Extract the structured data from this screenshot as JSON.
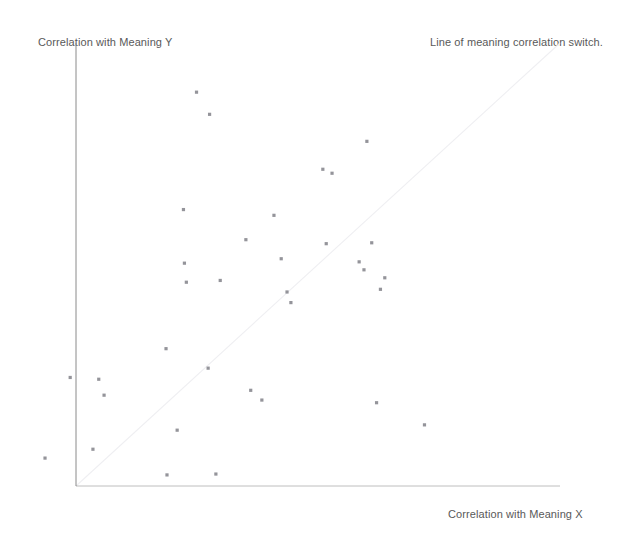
{
  "figure": {
    "title_note": "Line of meaning correlation switch.",
    "ylabel": "Correlation with Meaning Y",
    "xlabel": "Correlation with Meaning X",
    "background_color": "#ffffff",
    "axis_color": "#8a8a8a",
    "marker_color": "#7c7c84",
    "reference_line_color": "#efeff2"
  },
  "chart_data": {
    "type": "scatter",
    "title": "",
    "subtitle": "",
    "xlabel": "Correlation with Meaning X",
    "ylabel": "Correlation with Meaning Y",
    "annotations": [
      "Line of meaning correlation switch."
    ],
    "grid": false,
    "legend": "none",
    "xlim": [
      0,
      1
    ],
    "ylim": [
      0,
      1
    ],
    "axis_ticks": "none",
    "reference_line": {
      "label": "Line of meaning correlation switch.",
      "type": "identity",
      "from": [
        0,
        0
      ],
      "to": [
        1,
        1
      ],
      "style": "faint-solid"
    },
    "series": [
      {
        "name": "meaning correlations",
        "marker": "square",
        "color": "#7c7c84",
        "points": [
          {
            "x": 0.249,
            "y": 0.889
          },
          {
            "x": 0.276,
            "y": 0.839
          },
          {
            "x": 0.601,
            "y": 0.778
          },
          {
            "x": 0.51,
            "y": 0.715
          },
          {
            "x": 0.529,
            "y": 0.706
          },
          {
            "x": 0.222,
            "y": 0.624
          },
          {
            "x": 0.409,
            "y": 0.611
          },
          {
            "x": 0.351,
            "y": 0.556
          },
          {
            "x": 0.517,
            "y": 0.547
          },
          {
            "x": 0.611,
            "y": 0.549
          },
          {
            "x": 0.424,
            "y": 0.513
          },
          {
            "x": 0.224,
            "y": 0.503
          },
          {
            "x": 0.585,
            "y": 0.506
          },
          {
            "x": 0.228,
            "y": 0.46
          },
          {
            "x": 0.595,
            "y": 0.488
          },
          {
            "x": 0.298,
            "y": 0.464
          },
          {
            "x": 0.638,
            "y": 0.47
          },
          {
            "x": 0.629,
            "y": 0.444
          },
          {
            "x": 0.436,
            "y": 0.438
          },
          {
            "x": 0.444,
            "y": 0.414
          },
          {
            "x": 0.186,
            "y": 0.31
          },
          {
            "x": 0.273,
            "y": 0.266
          },
          {
            "x": 0.047,
            "y": 0.241
          },
          {
            "x": 0.058,
            "y": 0.205
          },
          {
            "x": 0.361,
            "y": 0.216
          },
          {
            "x": 0.384,
            "y": 0.194
          },
          {
            "x": 0.621,
            "y": 0.188
          },
          {
            "x": 0.209,
            "y": 0.126
          },
          {
            "x": 0.72,
            "y": 0.138
          },
          {
            "x": -0.012,
            "y": 0.245
          },
          {
            "x": 0.035,
            "y": 0.083
          },
          {
            "x": -0.064,
            "y": 0.063
          },
          {
            "x": 0.188,
            "y": 0.025
          },
          {
            "x": 0.289,
            "y": 0.027
          }
        ]
      }
    ]
  }
}
